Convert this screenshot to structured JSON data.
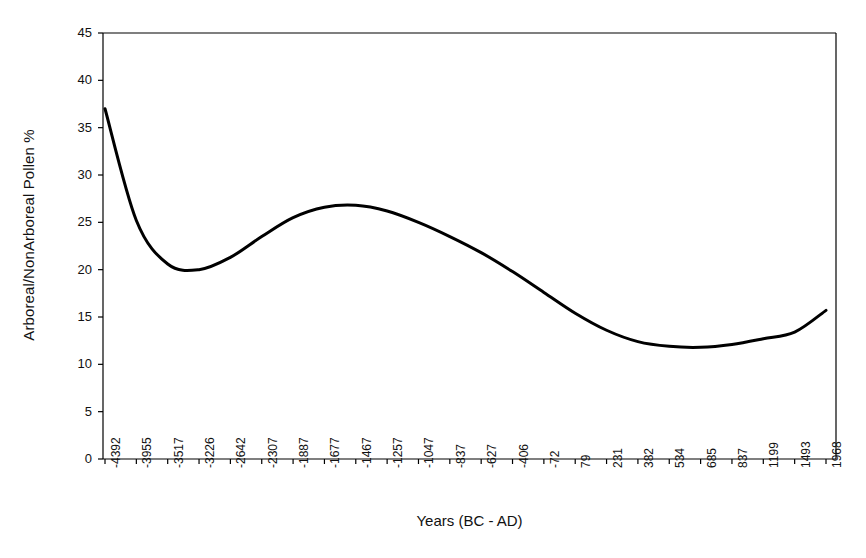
{
  "chart_data": {
    "type": "line",
    "title": "",
    "xlabel": "Years (BC - AD)",
    "ylabel": "Arboreal/NonArboreal Pollen %",
    "categories": [
      "-4392",
      "-3955",
      "-3517",
      "-3226",
      "-2642",
      "-2307",
      "-1887",
      "-1677",
      "-1467",
      "-1257",
      "-1047",
      "-837",
      "-627",
      "-406",
      "-72",
      "79",
      "231",
      "382",
      "534",
      "685",
      "837",
      "1199",
      "1493",
      "1968"
    ],
    "values": [
      37.0,
      25.2,
      20.6,
      20.0,
      21.3,
      23.5,
      25.5,
      26.6,
      26.8,
      26.2,
      25.0,
      23.5,
      21.8,
      19.8,
      17.6,
      15.4,
      13.6,
      12.4,
      11.9,
      11.8,
      12.1,
      12.7,
      13.4,
      15.7
    ],
    "ylim": [
      0,
      45
    ],
    "yticks": [
      0,
      5,
      10,
      15,
      20,
      25,
      30,
      35,
      40,
      45
    ],
    "grid": false,
    "legend": false,
    "line_color": "#000000",
    "line_width": 3,
    "smooth": true,
    "axis_color": "#000000",
    "background": "#ffffff"
  },
  "axes": {
    "y_axis_name": "y-axis",
    "x_axis_name": "x-axis"
  }
}
